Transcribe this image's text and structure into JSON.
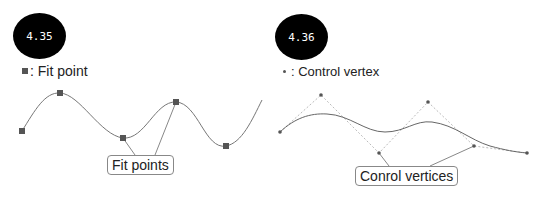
{
  "left_panel": {
    "badge": "4.35",
    "legend_label": ": Fit point",
    "legend_icon": "filled-square",
    "callout": "Fit points",
    "fit_points": [
      [
        22,
        131
      ],
      [
        60,
        93
      ],
      [
        123,
        138
      ],
      [
        176,
        102
      ],
      [
        226,
        146
      ]
    ]
  },
  "right_panel": {
    "badge": "4.36",
    "legend_label": ": Control vertex",
    "legend_icon": "small-dot",
    "callout": "Conrol vertices",
    "control_vertices": [
      [
        280,
        132
      ],
      [
        321,
        95
      ],
      [
        379,
        153
      ],
      [
        428,
        102
      ],
      [
        474,
        146
      ],
      [
        527,
        153
      ]
    ]
  },
  "colors": {
    "badge_bg": "#000000",
    "curve": "#777777",
    "point": "#555555",
    "leader": "#888888"
  }
}
